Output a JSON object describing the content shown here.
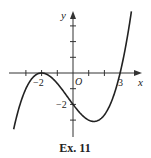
{
  "chart_data": {
    "type": "line",
    "title": "",
    "caption": "Ex. 11",
    "xlabel": "x",
    "ylabel": "y",
    "origin_label": "O",
    "function": "y = (1/6)(x+2)^2(x-3)",
    "xlim": [
      -4,
      4.3
    ],
    "ylim": [
      -4.2,
      3.9
    ],
    "x_tick_positions": [
      -3,
      -2,
      -1,
      1,
      2
    ],
    "y_tick_positions": [
      3,
      2,
      1,
      -1,
      -2,
      -3
    ],
    "labeled_points": [
      {
        "label": "-2",
        "axis": "x",
        "value": -2
      },
      {
        "label": "3",
        "axis": "x",
        "value": 3
      },
      {
        "label": "-2",
        "axis": "y",
        "value": -2
      }
    ],
    "key_points": [
      {
        "x": -2,
        "y": 0,
        "note": "local maximum, touches x-axis"
      },
      {
        "x": 0,
        "y": -2,
        "note": "y-intercept"
      },
      {
        "x": 1.33,
        "y": -3.09,
        "note": "local minimum"
      },
      {
        "x": 3,
        "y": 0,
        "note": "x-intercept"
      }
    ],
    "series": [
      {
        "name": "curve",
        "x": [
          -3.75,
          -3.5,
          -3.0,
          -2.5,
          -2.0,
          -1.5,
          -1.0,
          -0.5,
          0.0,
          0.5,
          1.0,
          1.33,
          1.5,
          2.0,
          2.5,
          3.0,
          3.3,
          3.5,
          3.7
        ],
        "values": [
          -3.48,
          -2.54,
          -1.0,
          -0.23,
          0.0,
          -0.19,
          -0.67,
          -1.35,
          -2.0,
          -2.6,
          -3.0,
          -3.09,
          -3.06,
          -2.67,
          -1.69,
          0.0,
          1.41,
          2.56,
          3.7
        ]
      }
    ],
    "grid": false,
    "legend": "none"
  },
  "labels": {
    "x_axis": "x",
    "y_axis": "y",
    "origin": "O",
    "x_neg2": "−2",
    "x_3": "3",
    "y_neg2": "−2",
    "caption": "Ex. 11"
  }
}
